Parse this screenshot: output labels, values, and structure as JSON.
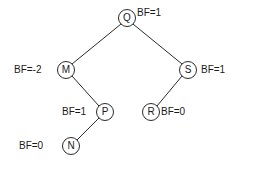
{
  "diagram": {
    "type": "binary-tree",
    "stroke_color": "#2b2b2b",
    "text_color": "#1a1a1a",
    "background_color": "#ffffff",
    "nodes": [
      {
        "id": "Q",
        "label": "Q",
        "bf_text": "BF=1",
        "bf_value": 1,
        "cx": 127,
        "cy": 18,
        "r": 8,
        "label_side": "right",
        "label_x": 137,
        "label_y": 8
      },
      {
        "id": "M",
        "label": "M",
        "bf_text": "BF=-2",
        "bf_value": -2,
        "cx": 66,
        "cy": 70,
        "r": 8,
        "label_side": "left",
        "label_x": 14,
        "label_y": 65
      },
      {
        "id": "S",
        "label": "S",
        "bf_text": "BF=1",
        "bf_value": 1,
        "cx": 188,
        "cy": 70,
        "r": 8,
        "label_side": "right",
        "label_x": 201,
        "label_y": 65
      },
      {
        "id": "P",
        "label": "P",
        "bf_text": "BF=1",
        "bf_value": 1,
        "cx": 105,
        "cy": 112,
        "r": 8,
        "label_side": "left",
        "label_x": 62,
        "label_y": 107
      },
      {
        "id": "R",
        "label": "R",
        "bf_text": "BF=0",
        "bf_value": 0,
        "cx": 151,
        "cy": 112,
        "r": 8,
        "label_side": "right",
        "label_x": 161,
        "label_y": 107
      },
      {
        "id": "N",
        "label": "N",
        "bf_text": "BF=0",
        "bf_value": 0,
        "cx": 71,
        "cy": 146,
        "r": 8,
        "label_side": "left",
        "label_x": 19,
        "label_y": 141
      }
    ],
    "edges": [
      {
        "from": "Q",
        "to": "M",
        "x1": 121,
        "y1": 24,
        "x2": 72,
        "y2": 64
      },
      {
        "from": "Q",
        "to": "S",
        "x1": 133,
        "y1": 24,
        "x2": 182,
        "y2": 64
      },
      {
        "from": "M",
        "to": "P",
        "x1": 72,
        "y1": 76,
        "x2": 99,
        "y2": 106
      },
      {
        "from": "S",
        "to": "R",
        "x1": 182,
        "y1": 76,
        "x2": 157,
        "y2": 106
      },
      {
        "from": "P",
        "to": "N",
        "x1": 99,
        "y1": 118,
        "x2": 77,
        "y2": 140
      }
    ]
  }
}
